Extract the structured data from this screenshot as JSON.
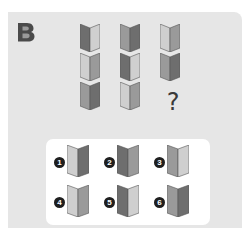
{
  "puzzle": {
    "label": "B",
    "question_mark": "?",
    "colors": {
      "dark": "#6e6e6e",
      "mid": "#9a9a9a",
      "light": "#cfcfcf"
    },
    "grid": [
      [
        {
          "left": "dark",
          "right": "light"
        },
        {
          "left": "light",
          "right": "mid"
        },
        {
          "left": "mid",
          "right": "dark"
        }
      ],
      [
        {
          "left": "mid",
          "right": "dark"
        },
        {
          "left": "dark",
          "right": "light"
        },
        {
          "left": "light",
          "right": "mid"
        }
      ],
      [
        {
          "left": "light",
          "right": "mid"
        },
        {
          "left": "mid",
          "right": "dark"
        },
        null
      ]
    ],
    "options": [
      {
        "number": "1",
        "left": "light",
        "right": "dark"
      },
      {
        "number": "2",
        "left": "dark",
        "right": "mid"
      },
      {
        "number": "3",
        "left": "mid",
        "right": "light"
      },
      {
        "number": "4",
        "left": "light",
        "right": "mid"
      },
      {
        "number": "5",
        "left": "dark",
        "right": "light"
      },
      {
        "number": "6",
        "left": "mid",
        "right": "dark"
      }
    ]
  }
}
